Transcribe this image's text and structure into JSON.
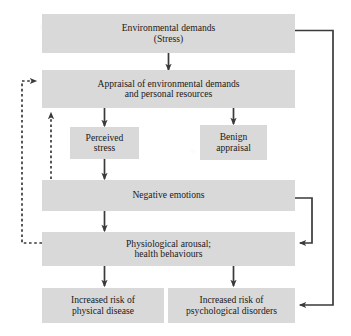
{
  "figure": {
    "type": "flowchart",
    "colors": {
      "box_fill": "#d9d9d9",
      "text": "#1a1a1a",
      "line": "#3a3a3a",
      "background": "#ffffff"
    }
  },
  "boxes": {
    "environmental_demands": {
      "line1": "Environmental demands",
      "line2": "(Stress)"
    },
    "appraisal": {
      "line1": "Appraisal of environmental demands",
      "line2": "and personal resources"
    },
    "perceived_stress": {
      "line1": "Perceived",
      "line2": "stress"
    },
    "benign_appraisal": {
      "line1": "Benign",
      "line2": "appraisal"
    },
    "negative_emotions": {
      "line1": "Negative emotions",
      "line2": ""
    },
    "physiological_arousal": {
      "line1": "Physiological arousal;",
      "line2": "health behaviours"
    },
    "increased_risk_physical": {
      "line1": "Increased risk of",
      "line2": "physical disease"
    },
    "increased_risk_psychological": {
      "line1": "Increased risk of",
      "line2": "psychological disorders"
    }
  },
  "connections": [
    {
      "name": "environmental-demands-to-appraisal",
      "style": "solid",
      "arrow": "down"
    },
    {
      "name": "appraisal-to-perceived-stress",
      "style": "solid",
      "arrow": "down"
    },
    {
      "name": "appraisal-to-benign-appraisal",
      "style": "solid",
      "arrow": "down"
    },
    {
      "name": "perceived-stress-to-negative-emotions",
      "style": "solid",
      "arrow": "down"
    },
    {
      "name": "negative-emotions-to-physiological-arousal",
      "style": "solid",
      "arrow": "down"
    },
    {
      "name": "physiological-arousal-to-increased-risk-physical",
      "style": "solid",
      "arrow": "down"
    },
    {
      "name": "physiological-arousal-to-increased-risk-psychological",
      "style": "solid",
      "arrow": "down"
    },
    {
      "name": "negative-emotions-feedback-to-physiological-arousal",
      "style": "solid",
      "arrow": "left"
    },
    {
      "name": "right-outer-loop-to-environmental-demands",
      "style": "solid",
      "arrow": "none"
    },
    {
      "name": "right-outer-loop-to-increased-risk-psychological",
      "style": "solid",
      "arrow": "left"
    },
    {
      "name": "negative-emotions-dashed-to-appraisal",
      "style": "dashed",
      "arrow": "up"
    },
    {
      "name": "physiological-arousal-dashed-to-appraisal",
      "style": "dashed",
      "arrow": "right"
    }
  ]
}
